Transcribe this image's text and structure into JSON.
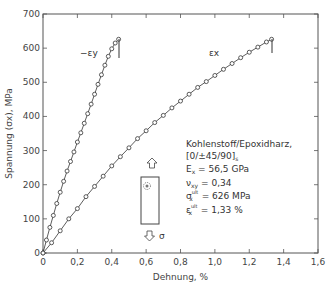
{
  "chart_data": {
    "type": "line",
    "title": "",
    "xlabel": "Dehnung, %",
    "ylabel": "Spannung (σx), MPa",
    "xlim": [
      0,
      1.6
    ],
    "ylim": [
      0,
      700
    ],
    "x_ticks": [
      "0",
      "0,2",
      "0,4",
      "0,6",
      "0,8",
      "1,0",
      "1,2",
      "1,4",
      "1,6"
    ],
    "y_ticks": [
      "0",
      "100",
      "200",
      "300",
      "400",
      "500",
      "600",
      "700"
    ],
    "grid": false,
    "series": [
      {
        "name": "-εy",
        "marker": "circle-open",
        "x": [
          0,
          0.02,
          0.04,
          0.06,
          0.08,
          0.1,
          0.12,
          0.14,
          0.16,
          0.18,
          0.2,
          0.22,
          0.24,
          0.26,
          0.28,
          0.3,
          0.32,
          0.34,
          0.36,
          0.38,
          0.4,
          0.42,
          0.44
        ],
        "y": [
          0,
          38,
          75,
          110,
          145,
          178,
          210,
          240,
          268,
          296,
          325,
          352,
          380,
          408,
          436,
          465,
          494,
          522,
          550,
          576,
          598,
          615,
          626
        ]
      },
      {
        "name": "εx",
        "marker": "circle-open",
        "x": [
          0,
          0.05,
          0.1,
          0.15,
          0.2,
          0.25,
          0.3,
          0.35,
          0.4,
          0.45,
          0.5,
          0.55,
          0.6,
          0.65,
          0.7,
          0.75,
          0.8,
          0.85,
          0.9,
          0.95,
          1.0,
          1.05,
          1.1,
          1.15,
          1.2,
          1.25,
          1.3,
          1.33
        ],
        "y": [
          0,
          30,
          65,
          100,
          130,
          165,
          195,
          225,
          255,
          282,
          308,
          335,
          358,
          382,
          403,
          425,
          445,
          465,
          485,
          502,
          520,
          538,
          555,
          572,
          588,
          603,
          618,
          626
        ]
      }
    ],
    "annotations": [
      "Kohlenstoff/Epoxidharz,",
      "[0/±45/90]s",
      "Ex = 56,5 GPa",
      "νxy = 0,34",
      "σx ult = 626 MPa",
      "εx ult = 1,33 %"
    ]
  },
  "labels": {
    "curve_ey": "−εy",
    "curve_ex": "εx",
    "sigma": "σ",
    "material": "Kohlenstoff/Epoxidharz,",
    "layup": "[0/±45/90]",
    "layup_sub": "s",
    "ex_name": "E",
    "ex_sub": "x",
    "ex_val": " = 56,5 GPa",
    "nu_name": "ν",
    "nu_sub": "xy",
    "nu_val": " = 0,34",
    "sig_name": "σ",
    "sig_sub": "x",
    "sig_sup": "ult",
    "sig_val": " = 626 MPa",
    "eps_name": "ε",
    "eps_sub": "x",
    "eps_sup": "ult",
    "eps_val": " = 1,33 %"
  }
}
